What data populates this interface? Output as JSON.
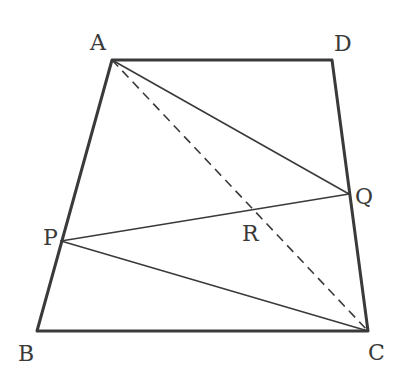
{
  "diagram": {
    "type": "geometry",
    "figure": "trapezoid",
    "points": {
      "A": {
        "label": "A",
        "x": 112,
        "y": 60
      },
      "D": {
        "label": "D",
        "x": 332,
        "y": 60
      },
      "B": {
        "label": "B",
        "x": 37,
        "y": 331
      },
      "C": {
        "label": "C",
        "x": 368,
        "y": 331
      },
      "P": {
        "label": "P",
        "x": 61,
        "y": 241
      },
      "Q": {
        "label": "Q",
        "x": 349,
        "y": 194
      },
      "R": {
        "label": "R",
        "x": 254,
        "y": 212
      }
    },
    "segments": [
      {
        "from": "A",
        "to": "D",
        "style": "thick"
      },
      {
        "from": "D",
        "to": "C",
        "style": "thick"
      },
      {
        "from": "C",
        "to": "B",
        "style": "thick"
      },
      {
        "from": "B",
        "to": "A",
        "style": "thick"
      },
      {
        "from": "A",
        "to": "Q",
        "style": "thin"
      },
      {
        "from": "P",
        "to": "Q",
        "style": "thin"
      },
      {
        "from": "P",
        "to": "C",
        "style": "thin"
      },
      {
        "from": "A",
        "to": "C",
        "style": "dashed"
      }
    ],
    "labels": {
      "A": "A",
      "B": "B",
      "C": "C",
      "D": "D",
      "P": "P",
      "Q": "Q",
      "R": "R"
    }
  }
}
